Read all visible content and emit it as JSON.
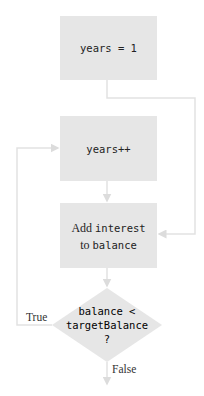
{
  "flowchart": {
    "colors": {
      "box_fill": "#e6e6e6",
      "line": "#e0e0e0",
      "text": "#222222"
    },
    "nodes": {
      "init": {
        "text": "years = 1"
      },
      "increment": {
        "text": "years++"
      },
      "add_interest": {
        "part1": "Add ",
        "part2": "interest",
        "part3": "to ",
        "part4": "balance"
      },
      "decision": {
        "line1": "balance <",
        "line2": "targetBalance",
        "line3": "?"
      }
    },
    "edges": {
      "true_label": "True",
      "false_label": "False"
    }
  }
}
